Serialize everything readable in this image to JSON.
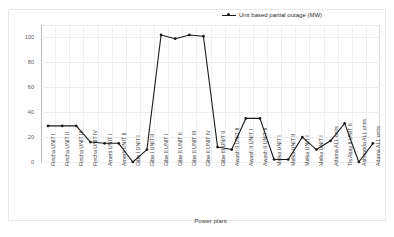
{
  "chart_data": {
    "type": "line",
    "title": "",
    "xlabel": "Power plant",
    "ylabel": "Power (MW)",
    "ylim": [
      0,
      110
    ],
    "yticks": [
      0,
      20,
      40,
      60,
      80,
      100
    ],
    "grid": true,
    "legend_position": "top-right",
    "legend": [
      "Unit based partial outage (MW)"
    ],
    "series_name": "Unit based partial outage (MW)",
    "series_color": "#1a1a1a",
    "marker": "square-dot",
    "categories": [
      "Fincha UNIT I",
      "Fincha UNIT II",
      "Fincha UNIT III",
      "Fincha UNIT IV",
      "Amerti UNIT I",
      "Amerti UNIT II",
      "Gibe I UNIT I",
      "Gibe I UNIT II",
      "Gibe II UNIT I",
      "Gibe II UNIT II",
      "Gibe II UNIT III",
      "Gibe II UNIT IV",
      "Gibe III UNIT II",
      "Awash II UNIT II",
      "Awash II UNIT I",
      "Awash II UNIT II",
      "Melka UNIT I",
      "Melka UNIT II",
      "Melka UNIT I",
      "Melka UNIT I",
      "Adama ALL units",
      "Tis Abay II UNIT II",
      "Ashegoda ALL units",
      "Adama ALL units"
    ],
    "values": [
      29,
      29,
      29,
      16,
      15,
      15,
      0,
      10,
      102,
      99,
      102,
      101,
      12,
      10,
      35,
      35,
      2,
      2,
      20,
      10,
      17,
      31,
      0,
      15
    ]
  }
}
